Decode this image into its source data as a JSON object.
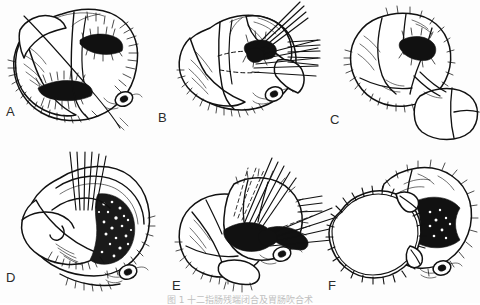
{
  "figure": {
    "type": "surgical-technique-plate",
    "panel_count": 6,
    "orientation": "2 rows x 3 columns",
    "ink_color": "#111111",
    "background_color": "#fdfdfd",
    "label_color": "#2b2b2b",
    "caption": "图 1  十二指肠残端闭合及胃肠吹合术",
    "caption_visible": "partially cropped at bottom edge"
  },
  "panels": [
    {
      "id": "A",
      "label": "A",
      "label_x": 6,
      "label_y": 112,
      "title": "Opened bowel segment with exposed lumen and traction suture",
      "features": [
        "bowel loop",
        "open lumen",
        "mucosal hatching",
        "serosal folds",
        "single traction suture",
        "vascular stump"
      ]
    },
    {
      "id": "B",
      "label": "B",
      "label_x": 158,
      "label_y": 118,
      "title": "Placement of interrupted stay sutures across posterior wall",
      "features": [
        "bowel loop",
        "suture bundle upper",
        "suture bundle right",
        "dashed incision line",
        "vascular stump"
      ]
    },
    {
      "id": "C",
      "label": "C",
      "label_x": 330,
      "label_y": 119,
      "title": "Approximated limbs with adjacent closed segment",
      "features": [
        "bowel loop",
        "closed lumen",
        "second closed segment",
        "suture line"
      ]
    },
    {
      "id": "D",
      "label": "D",
      "label_x": 6,
      "label_y": 272,
      "title": "Posterior layer sutures drawn up, mucosal surface shown",
      "features": [
        "bowel loop",
        "parallel suture strands",
        "stippled mucosa",
        "serosal hatching",
        "vascular stump"
      ]
    },
    {
      "id": "E",
      "label": "E",
      "label_x": 172,
      "label_y": 281,
      "title": "Anterior layer sutures being tied",
      "features": [
        "two bowel limbs",
        "upper suture bundle",
        "lateral suture bundle",
        "dashed approximation lines",
        "vascular stump"
      ]
    },
    {
      "id": "F",
      "label": "F",
      "label_x": 328,
      "label_y": 281,
      "title": "Completed anastomosis with continuous running suture line",
      "features": [
        "completed closure",
        "running suture stitches",
        "open lumen remnant",
        "vascular stump"
      ]
    }
  ]
}
